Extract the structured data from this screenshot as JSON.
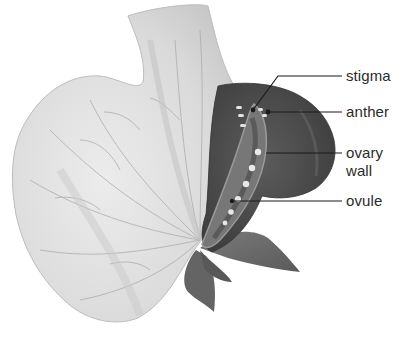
{
  "figure": {
    "labels": [
      {
        "id": "stigma",
        "text": "stigma"
      },
      {
        "id": "anther",
        "text": "anther"
      },
      {
        "id": "ovary_wall",
        "text": "ovary\nwall",
        "line1": "ovary",
        "line2": "wall"
      },
      {
        "id": "ovule",
        "text": "ovule"
      }
    ],
    "caption_clipped": ""
  },
  "colors": {
    "background": "#ffffff",
    "petal": "#dcdcdc",
    "petal_vein": "#a8a8a8",
    "keel_dark": "#4a4a4a",
    "sepal": "#6e6e6e",
    "ovule": "#e6e6e6",
    "label_text": "#2b2b2b",
    "leader_line": "#1a1a1a"
  }
}
